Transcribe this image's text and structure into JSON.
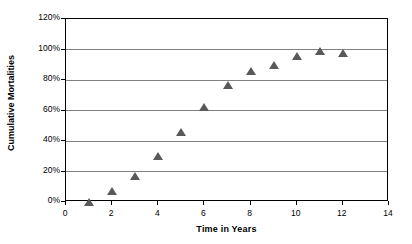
{
  "chart_data": {
    "type": "scatter",
    "title": "",
    "xlabel": "Time in Years",
    "ylabel": "Cumulative Mortalities",
    "xlim": [
      0,
      14
    ],
    "ylim": [
      0,
      1.2
    ],
    "xticks": [
      "0",
      "2",
      "4",
      "6",
      "8",
      "10",
      "12",
      "14"
    ],
    "xtick_values": [
      0,
      2,
      4,
      6,
      8,
      10,
      12,
      14
    ],
    "yticks": [
      "0%",
      "20%",
      "40%",
      "60%",
      "80%",
      "100%",
      "120%"
    ],
    "ytick_values": [
      0,
      0.2,
      0.4,
      0.6,
      0.8,
      1.0,
      1.2
    ],
    "grid": "horizontal",
    "legend": "none",
    "marker": "triangle",
    "marker_color": "#595959",
    "gridline_color": "#808080",
    "frame_color": "#000000",
    "background_color": "#ffffff",
    "x": [
      1,
      2,
      3,
      4,
      5,
      6,
      7,
      8,
      9,
      10,
      11,
      12
    ],
    "y": [
      0.0,
      0.07,
      0.17,
      0.3,
      0.46,
      0.62,
      0.77,
      0.86,
      0.9,
      0.96,
      0.99,
      0.98
    ],
    "points": [
      {
        "x": 1,
        "y": 0.0
      },
      {
        "x": 2,
        "y": 0.07
      },
      {
        "x": 3,
        "y": 0.17
      },
      {
        "x": 4,
        "y": 0.3
      },
      {
        "x": 5,
        "y": 0.46
      },
      {
        "x": 6,
        "y": 0.62
      },
      {
        "x": 7,
        "y": 0.77
      },
      {
        "x": 8,
        "y": 0.86
      },
      {
        "x": 9,
        "y": 0.9
      },
      {
        "x": 10,
        "y": 0.96
      },
      {
        "x": 11,
        "y": 0.99
      },
      {
        "x": 12,
        "y": 0.98
      }
    ]
  }
}
